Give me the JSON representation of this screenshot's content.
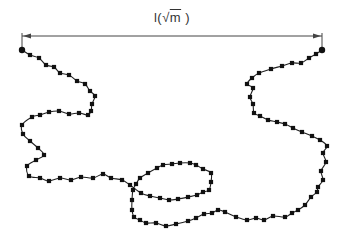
{
  "diagram": {
    "title_label": {
      "prefix": "l(",
      "sqrt_symbol": "√",
      "radicand": "m",
      "suffix": ")"
    },
    "colors": {
      "chain": "#222222",
      "bead": "#111111",
      "arrow": "#444444",
      "text": "#333333"
    },
    "dimension_arrow": {
      "x1": 22,
      "x2": 322,
      "y": 36,
      "tick_top": 33,
      "tick_bottom": 47
    },
    "endpoints": [
      {
        "x": 22,
        "y": 50,
        "r": 3.2
      },
      {
        "x": 322,
        "y": 50,
        "r": 3.2
      }
    ],
    "bead_size": 4.2,
    "chain_path": [
      [
        22,
        50
      ],
      [
        30,
        55
      ],
      [
        39,
        58
      ],
      [
        46,
        65
      ],
      [
        54,
        67
      ],
      [
        60,
        73
      ],
      [
        69,
        75
      ],
      [
        77,
        81
      ],
      [
        85,
        84
      ],
      [
        90,
        91
      ],
      [
        95,
        96
      ],
      [
        92,
        104
      ],
      [
        91,
        111
      ],
      [
        88,
        115
      ],
      [
        79,
        113
      ],
      [
        69,
        114
      ],
      [
        59,
        111
      ],
      [
        49,
        112
      ],
      [
        40,
        115
      ],
      [
        32,
        117
      ],
      [
        22,
        125
      ],
      [
        23,
        134
      ],
      [
        30,
        141
      ],
      [
        38,
        148
      ],
      [
        44,
        155
      ],
      [
        36,
        160
      ],
      [
        27,
        166
      ],
      [
        29,
        176
      ],
      [
        40,
        178
      ],
      [
        49,
        181
      ],
      [
        60,
        178
      ],
      [
        71,
        180
      ],
      [
        81,
        177
      ],
      [
        93,
        178
      ],
      [
        103,
        174
      ],
      [
        111,
        178
      ],
      [
        122,
        180
      ],
      [
        130,
        185
      ],
      [
        141,
        193
      ],
      [
        150,
        196
      ],
      [
        160,
        198
      ],
      [
        169,
        200
      ],
      [
        178,
        199
      ],
      [
        188,
        197
      ],
      [
        197,
        195
      ],
      [
        203,
        192
      ],
      [
        209,
        190
      ],
      [
        211,
        182
      ],
      [
        211,
        173
      ],
      [
        203,
        169
      ],
      [
        196,
        165
      ],
      [
        190,
        163
      ],
      [
        180,
        163
      ],
      [
        172,
        164
      ],
      [
        163,
        165
      ],
      [
        157,
        168
      ],
      [
        148,
        173
      ],
      [
        140,
        178
      ],
      [
        136,
        184
      ],
      [
        133,
        190
      ],
      [
        132,
        200
      ],
      [
        132,
        210
      ],
      [
        134,
        217
      ],
      [
        140,
        220
      ],
      [
        146,
        223
      ],
      [
        156,
        223
      ],
      [
        166,
        226
      ],
      [
        176,
        224
      ],
      [
        188,
        221
      ],
      [
        196,
        218
      ],
      [
        204,
        214
      ],
      [
        212,
        213
      ],
      [
        218,
        210
      ],
      [
        225,
        212
      ],
      [
        236,
        217
      ],
      [
        247,
        220
      ],
      [
        256,
        218
      ],
      [
        264,
        220
      ],
      [
        273,
        216
      ],
      [
        285,
        217
      ],
      [
        292,
        213
      ],
      [
        298,
        210
      ],
      [
        305,
        205
      ],
      [
        311,
        197
      ],
      [
        317,
        192
      ],
      [
        318,
        187
      ],
      [
        323,
        180
      ],
      [
        321,
        171
      ],
      [
        326,
        162
      ],
      [
        323,
        153
      ],
      [
        327,
        146
      ],
      [
        320,
        140
      ],
      [
        312,
        136
      ],
      [
        302,
        132
      ],
      [
        293,
        128
      ],
      [
        285,
        124
      ],
      [
        277,
        122
      ],
      [
        268,
        120
      ],
      [
        260,
        116
      ],
      [
        254,
        113
      ],
      [
        253,
        104
      ],
      [
        250,
        97
      ],
      [
        253,
        88
      ],
      [
        247,
        84
      ],
      [
        252,
        78
      ],
      [
        259,
        73
      ],
      [
        271,
        69
      ],
      [
        282,
        66
      ],
      [
        292,
        63
      ],
      [
        301,
        63
      ],
      [
        309,
        58
      ],
      [
        316,
        54
      ],
      [
        322,
        50
      ]
    ]
  }
}
